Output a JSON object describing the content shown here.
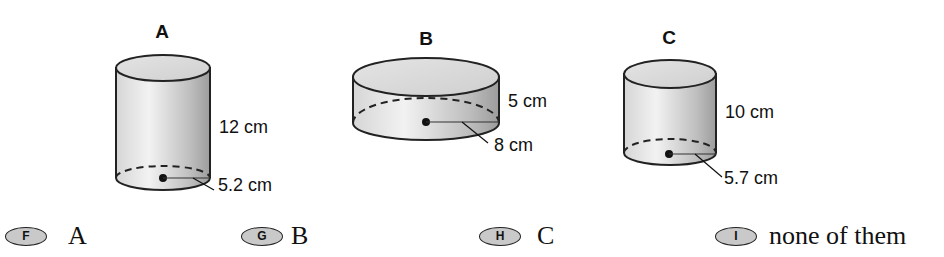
{
  "figures": [
    {
      "label": "A",
      "height": "12 cm",
      "radius": "5.2 cm"
    },
    {
      "label": "B",
      "height": "5 cm",
      "radius": "8 cm"
    },
    {
      "label": "C",
      "height": "10 cm",
      "radius": "5.7 cm"
    }
  ],
  "answers": [
    {
      "letter": "F",
      "text": "A"
    },
    {
      "letter": "G",
      "text": "B"
    },
    {
      "letter": "H",
      "text": "C"
    },
    {
      "letter": "I",
      "text": "none of them"
    }
  ],
  "colors": {
    "bubble_fill": "#c9c9c9",
    "ink": "#111111"
  }
}
